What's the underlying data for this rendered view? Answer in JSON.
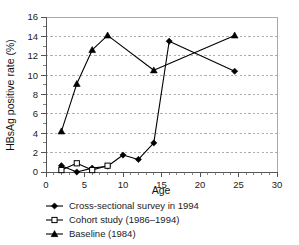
{
  "chart_data": {
    "type": "line",
    "title": "",
    "xlabel": "Age",
    "ylabel": "HBsAg positive rate (%)",
    "xlim": [
      0,
      30
    ],
    "ylim": [
      0,
      16
    ],
    "xticks": [
      0,
      5,
      10,
      15,
      20,
      25,
      30
    ],
    "yticks": [
      0,
      2,
      4,
      6,
      8,
      10,
      12,
      14,
      16
    ],
    "xtick_labels": [
      "0",
      "5",
      "10",
      "15",
      "20",
      "25",
      "30"
    ],
    "ytick_labels": [
      "0",
      "2",
      "4",
      "6",
      "8",
      "10",
      "12",
      "14",
      "16"
    ],
    "x_minor_step": 1,
    "y_minor_step": 1,
    "grid": "horizontal-dashed",
    "legend_position": "below-left",
    "series": [
      {
        "name": "Cross-sectional survey in 1994",
        "marker": "filled-diamond",
        "color": "#000000",
        "x": [
          2,
          4,
          6,
          8,
          10,
          12,
          14,
          16,
          24.5
        ],
        "values": [
          0.65,
          0.0,
          0.4,
          0.6,
          1.75,
          1.3,
          3.0,
          13.5,
          10.4
        ]
      },
      {
        "name": "Cohort study (1986–1994)",
        "marker": "open-square",
        "color": "#000000",
        "x": [
          2,
          4,
          6,
          8
        ],
        "values": [
          0.2,
          0.9,
          0.2,
          0.65
        ]
      },
      {
        "name": "Baseline (1984)",
        "marker": "filled-triangle",
        "color": "#000000",
        "x": [
          2,
          4,
          6,
          8,
          14,
          24.5
        ],
        "values": [
          4.2,
          9.1,
          12.6,
          14.1,
          10.5,
          14.1
        ]
      }
    ]
  },
  "legend": {
    "items": [
      {
        "label": "Cross-sectional survey in 1994",
        "marker": "filled-diamond"
      },
      {
        "label": "Cohort study (1986–1994)",
        "marker": "open-square"
      },
      {
        "label": "Baseline (1984)",
        "marker": "filled-triangle"
      }
    ]
  },
  "axes": {
    "x_title": "Age",
    "y_title": "HBsAg positive rate (%)"
  }
}
